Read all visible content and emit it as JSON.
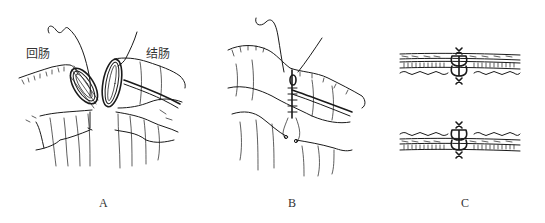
{
  "figure": {
    "panels": [
      {
        "id": "A",
        "label": "A",
        "annotations": [
          "回肠",
          "结肠"
        ]
      },
      {
        "id": "B",
        "label": "B",
        "annotations": []
      },
      {
        "id": "C",
        "label": "C",
        "annotations": []
      }
    ],
    "labels": {
      "ileum": "回肠",
      "colon": "结肠",
      "panel_a": "A",
      "panel_b": "B",
      "panel_c": "C"
    },
    "colors": {
      "ink": "#1a1a1a",
      "text": "#333333",
      "background": "#ffffff"
    }
  }
}
